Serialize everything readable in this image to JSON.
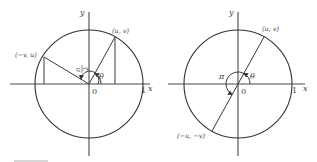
{
  "figures": [
    {
      "id": "left",
      "axes": {
        "x_label": "x",
        "y_label": "y",
        "origin_label": "0",
        "unit_label": "1"
      },
      "points": [
        {
          "label": "(u, v)"
        },
        {
          "label": "(−v, u)"
        }
      ],
      "angles": [
        {
          "label": "θ"
        },
        {
          "label_num": "π",
          "label_den": "2"
        }
      ]
    },
    {
      "id": "right",
      "axes": {
        "x_label": "x",
        "y_label": "y",
        "origin_label": "0",
        "unit_label": "1"
      },
      "points": [
        {
          "label": "(u, v)"
        },
        {
          "label": "(−u, −v)"
        }
      ],
      "angles": [
        {
          "label": "θ"
        },
        {
          "label": "π"
        }
      ]
    }
  ],
  "footer": {
    "rule_color": "#9a9a9a"
  }
}
